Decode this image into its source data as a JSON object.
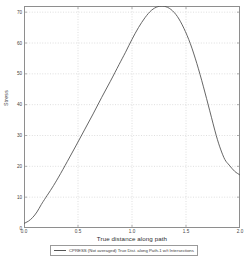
{
  "chart_data": {
    "type": "line",
    "title": "",
    "xlabel": "True distance along path",
    "ylabel": "Stress",
    "xlim": [
      0.0,
      2.0
    ],
    "ylim": [
      0,
      72
    ],
    "grid": true,
    "legend_position": "bottom",
    "x_ticks": [
      "0.0",
      "0.5",
      "1.0",
      "1.5",
      "2.0"
    ],
    "x_tick_values": [
      0.0,
      0.5,
      1.0,
      1.5,
      2.0
    ],
    "y_ticks": [
      "0",
      "10",
      "20",
      "30",
      "40",
      "50",
      "60",
      "70"
    ],
    "y_tick_values": [
      0,
      10,
      20,
      30,
      40,
      50,
      60,
      70
    ],
    "series": [
      {
        "name": "CPRESS (Not averaged)  True Dist. along Path-1 w/t Intersections",
        "color": "#555555",
        "x": [
          0.0,
          0.04,
          0.08,
          0.12,
          0.16,
          0.2,
          0.26,
          0.32,
          0.4,
          0.48,
          0.56,
          0.64,
          0.72,
          0.8,
          0.88,
          0.94,
          1.0,
          1.06,
          1.12,
          1.18,
          1.24,
          1.3,
          1.36,
          1.42,
          1.48,
          1.54,
          1.6,
          1.66,
          1.72,
          1.78,
          1.82,
          1.86,
          1.9,
          1.95,
          2.0
        ],
        "y": [
          1.5,
          2.2,
          3.4,
          5.2,
          7.6,
          9.8,
          13.0,
          16.5,
          21.5,
          26.6,
          31.8,
          37.0,
          42.4,
          47.6,
          53.0,
          57.0,
          61.2,
          65.0,
          68.2,
          70.6,
          71.8,
          71.9,
          70.9,
          68.6,
          64.8,
          59.8,
          53.4,
          46.0,
          38.0,
          30.0,
          25.6,
          22.2,
          20.4,
          18.4,
          17.2
        ]
      }
    ]
  },
  "legend": {
    "entry_label": "CPRESS (Not averaged)  True Dist. along Path-1 w/t Intersections"
  }
}
